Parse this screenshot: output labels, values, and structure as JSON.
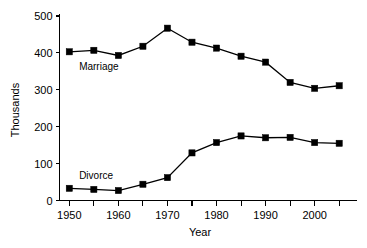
{
  "chart_data": {
    "type": "line",
    "title": "",
    "xlabel": "Year",
    "ylabel": "Thousands",
    "xlim": [
      1948,
      2007
    ],
    "ylim": [
      0,
      500
    ],
    "grid": false,
    "legend_position": "inline-annotation",
    "x": [
      1950,
      1955,
      1960,
      1965,
      1970,
      1975,
      1980,
      1985,
      1990,
      1995,
      2000,
      2005
    ],
    "x_ticks_major": [
      1950,
      1960,
      1970,
      1980,
      1990,
      2000
    ],
    "x_ticks_minor": [
      1955,
      1965,
      1975,
      1985,
      1995,
      2005
    ],
    "x_tick_labels": [
      "1950",
      "1960",
      "1970",
      "1980",
      "1990",
      "2000"
    ],
    "y_ticks": [
      0,
      100,
      200,
      300,
      400,
      500
    ],
    "y_tick_labels": [
      "0",
      "100",
      "200",
      "300",
      "400",
      "500"
    ],
    "series": [
      {
        "name": "Marriage",
        "label": "Marriage",
        "color": "#000000",
        "marker": "square",
        "label_x": 1952,
        "label_y": 355,
        "values": [
          403,
          407,
          393,
          418,
          467,
          429,
          413,
          391,
          375,
          320,
          304,
          311
        ]
      },
      {
        "name": "Divorce",
        "label": "Divorce",
        "color": "#000000",
        "marker": "square",
        "label_x": 1952,
        "label_y": 58,
        "values": [
          33,
          30,
          27,
          44,
          62,
          129,
          157,
          175,
          170,
          171,
          157,
          155
        ]
      }
    ]
  },
  "axes": {
    "x_axis_name": "year-axis",
    "y_axis_name": "thousands-axis"
  }
}
